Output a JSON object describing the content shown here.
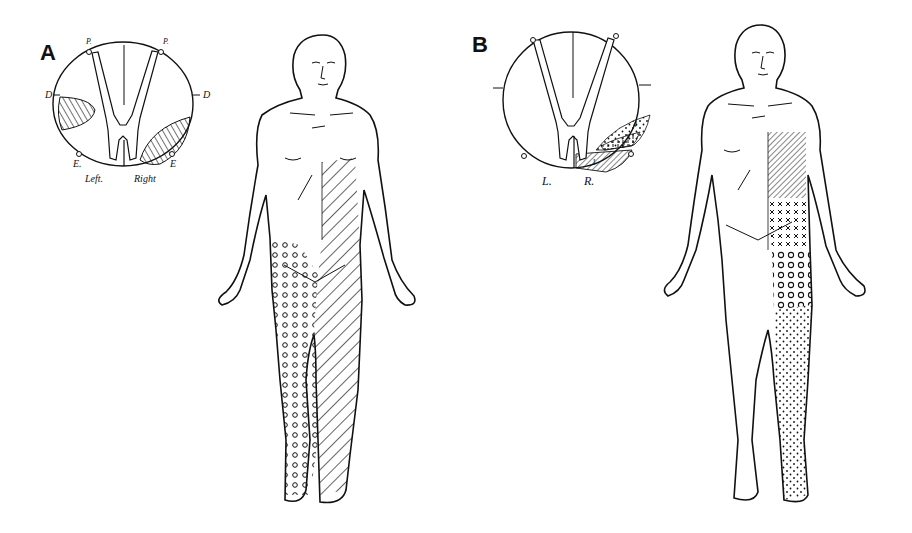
{
  "figure": {
    "panels": [
      {
        "id": "A",
        "label": "A",
        "cross_section": {
          "labels": {
            "posterior_left": "P.",
            "posterior_right": "P.",
            "dorsal_left": "D",
            "dorsal_right": "D",
            "entry_left": "E.",
            "entry_right": "E",
            "side_left": "Left.",
            "side_right": "Right"
          },
          "lesions": [
            "left lateral column (hatched)",
            "right anterolateral quadrant (hatched)"
          ]
        },
        "body_map": {
          "left_leg_pattern": "circles",
          "right_trunk_leg_pattern": "diagonal-hatch"
        }
      },
      {
        "id": "B",
        "label": "B",
        "cross_section": {
          "labels": {
            "side_left": "L.",
            "side_right": "R.",
            "zone_1": "1",
            "zone_2": "2",
            "zone_3": "3",
            "zone_4": "4"
          },
          "lesions": [
            "right anterolateral layered zones 1-4"
          ]
        },
        "body_map": {
          "chest_pattern": "fine-diagonal-hatch",
          "abdomen_pattern": "x-marks",
          "thigh_pattern": "circles",
          "lower_leg_pattern": "dots"
        }
      }
    ],
    "colors": {
      "ink": "#111111",
      "paper": "#ffffff"
    }
  }
}
